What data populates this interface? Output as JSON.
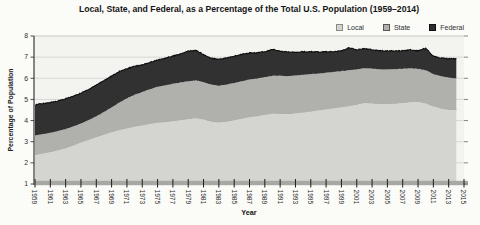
{
  "chart_data": {
    "type": "area",
    "stacked": true,
    "title": "Local, State, and Federal, as a Percentage of the Total U.S. Population (1959–2014)",
    "xlabel": "Year",
    "ylabel": "Percentage of Population",
    "ylim": [
      1,
      8
    ],
    "x_range": [
      1959,
      2015
    ],
    "grid": true,
    "legend_position": "top-right",
    "y_ticks": [
      1,
      2,
      3,
      4,
      5,
      6,
      7,
      8
    ],
    "x_tick_labels": [
      "1959",
      "1961",
      "1963",
      "1965",
      "1967",
      "1969",
      "1971",
      "1973",
      "1975",
      "1977",
      "1979",
      "1981",
      "1983",
      "1985",
      "1987",
      "1989",
      "1991",
      "1993",
      "1995",
      "1997",
      "1999",
      "2001",
      "2003",
      "2005",
      "2007",
      "2009",
      "2011",
      "2013",
      "2015"
    ],
    "years_start": 1959,
    "years_end": 2014,
    "series": [
      {
        "name": "Local",
        "color": "#d4d4d1",
        "edge_color": "#919191",
        "values": [
          2.4,
          2.47,
          2.54,
          2.62,
          2.72,
          2.85,
          3.0,
          3.12,
          3.24,
          3.36,
          3.48,
          3.58,
          3.66,
          3.74,
          3.8,
          3.87,
          3.93,
          3.95,
          4.0,
          4.05,
          4.1,
          4.14,
          4.08,
          3.98,
          3.94,
          3.98,
          4.04,
          4.12,
          4.19,
          4.24,
          4.3,
          4.36,
          4.35,
          4.34,
          4.37,
          4.41,
          4.46,
          4.51,
          4.56,
          4.61,
          4.66,
          4.71,
          4.78,
          4.86,
          4.84,
          4.81,
          4.81,
          4.83,
          4.86,
          4.9,
          4.92,
          4.84,
          4.7,
          4.6,
          4.54,
          4.52
        ]
      },
      {
        "name": "State",
        "color": "#b0b0ad",
        "edge_color": "",
        "values": [
          0.9,
          0.89,
          0.88,
          0.88,
          0.88,
          0.87,
          0.86,
          0.9,
          0.96,
          1.04,
          1.14,
          1.27,
          1.39,
          1.48,
          1.55,
          1.61,
          1.67,
          1.71,
          1.74,
          1.75,
          1.76,
          1.76,
          1.74,
          1.72,
          1.71,
          1.72,
          1.74,
          1.74,
          1.75,
          1.75,
          1.75,
          1.76,
          1.77,
          1.76,
          1.76,
          1.75,
          1.74,
          1.71,
          1.7,
          1.69,
          1.68,
          1.67,
          1.64,
          1.62,
          1.62,
          1.61,
          1.61,
          1.6,
          1.59,
          1.57,
          1.53,
          1.54,
          1.5,
          1.5,
          1.49,
          1.48
        ]
      },
      {
        "name": "Federal",
        "color": "#313131",
        "edge_color": "#0e0e0e",
        "values": [
          1.45,
          1.44,
          1.43,
          1.43,
          1.43,
          1.43,
          1.44,
          1.46,
          1.48,
          1.5,
          1.48,
          1.47,
          1.4,
          1.36,
          1.28,
          1.26,
          1.26,
          1.29,
          1.31,
          1.35,
          1.42,
          1.42,
          1.3,
          1.25,
          1.25,
          1.26,
          1.26,
          1.28,
          1.26,
          1.21,
          1.21,
          1.24,
          1.16,
          1.14,
          1.11,
          1.09,
          1.05,
          1.02,
          0.99,
          0.96,
          0.96,
          1.07,
          0.92,
          0.92,
          0.89,
          0.88,
          0.87,
          0.87,
          0.85,
          0.87,
          0.85,
          1.04,
          0.85,
          0.86,
          0.89,
          0.94
        ]
      }
    ],
    "colors": {
      "plot_bg": "#f3f3f0",
      "page_bg": "#fbfbf8",
      "gridline": "#d7d7d3",
      "top_border": "#c9c9c6",
      "axis": "#3a3a3a",
      "baseline_bar": "#a7a7a4",
      "tick": "#1c1c1c",
      "tick_label": "#2e2e2e"
    }
  }
}
